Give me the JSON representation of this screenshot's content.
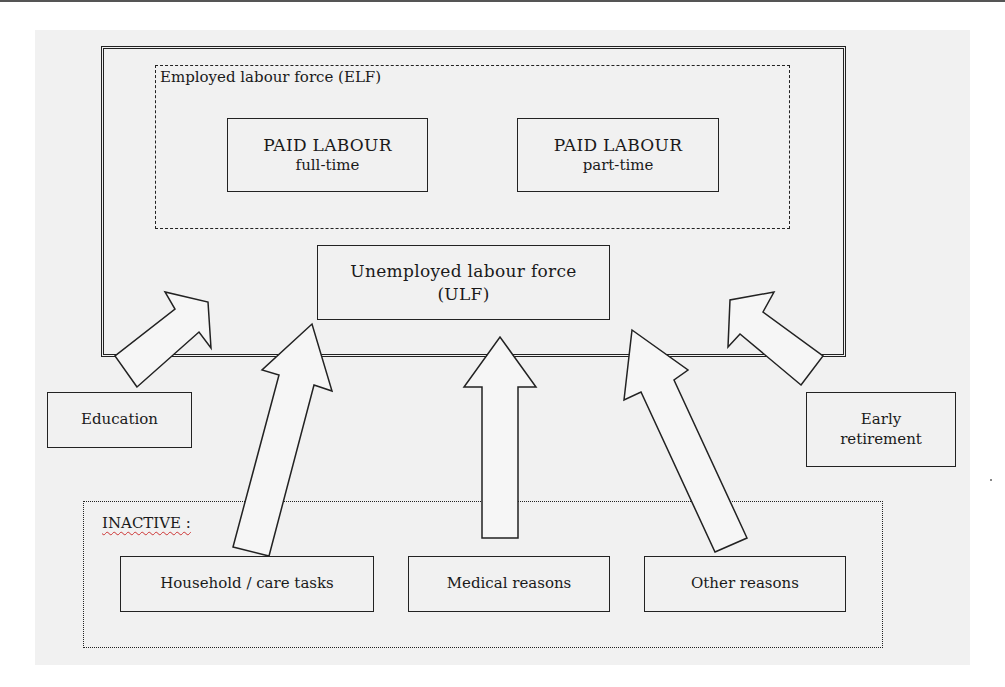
{
  "diagram": {
    "labour_force_region": {
      "employed_label": "Employed labour force (ELF)",
      "paid_full_time": {
        "title": "PAID LABOUR",
        "subtitle": "full-time"
      },
      "paid_part_time": {
        "title": "PAID LABOUR",
        "subtitle": "part-time"
      },
      "unemployed": {
        "line1": "Unemployed labour force",
        "line2": "(ULF)"
      }
    },
    "side_sources": {
      "education": "Education",
      "early_retirement": {
        "line1": "Early",
        "line2": "retirement"
      }
    },
    "inactive_region": {
      "label": "INACTIVE :",
      "items": [
        "Household / care tasks",
        "Medical reasons",
        "Other reasons"
      ]
    },
    "arrows": [
      {
        "from": "Education",
        "to": "Labour force"
      },
      {
        "from": "Household / care tasks",
        "to": "Labour force"
      },
      {
        "from": "Medical reasons",
        "to": "Labour force"
      },
      {
        "from": "Other reasons",
        "to": "Labour force"
      },
      {
        "from": "Early retirement",
        "to": "Labour force"
      }
    ]
  }
}
